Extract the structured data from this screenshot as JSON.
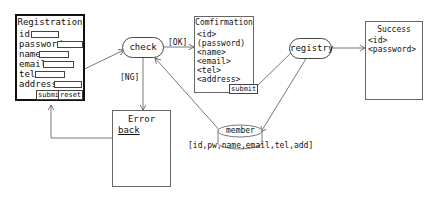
{
  "registration": {
    "title": "Registration",
    "fields": [
      {
        "label": "id"
      },
      {
        "label": "password"
      },
      {
        "label": "name"
      },
      {
        "label": "email"
      },
      {
        "label": "tel"
      },
      {
        "label": "address"
      }
    ],
    "submit_label": "submit",
    "reset_label": "reset"
  },
  "check": {
    "label": "check"
  },
  "transitions": {
    "ok": "[OK]",
    "ng": "[NG]"
  },
  "confirmation": {
    "title": "Comfirmation",
    "items": [
      "<id>",
      "(password)",
      "<name>",
      "<email>",
      "<tel>",
      "<address>"
    ],
    "submit_label": "submit"
  },
  "registry": {
    "label": "registry"
  },
  "success": {
    "title": "Success",
    "items": [
      "<id>",
      "<password>"
    ]
  },
  "error": {
    "title": "Error",
    "back_label": "back"
  },
  "member": {
    "label": "member",
    "columns": "[id,pw,name,email,tel,add]"
  }
}
